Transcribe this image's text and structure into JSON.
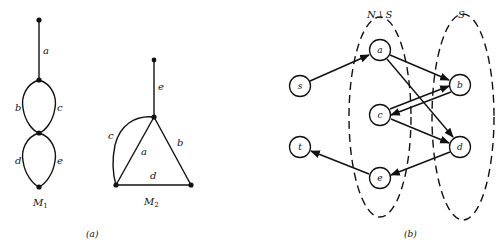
{
  "panel_a": {
    "caption": "(a)",
    "m1": {
      "name_main": "M",
      "name_sub": "1",
      "edges": {
        "a": "a",
        "b": "b",
        "c": "c",
        "d": "d",
        "e": "e"
      }
    },
    "m2": {
      "name_main": "M",
      "name_sub": "2",
      "edges": {
        "a": "a",
        "b": "b",
        "c": "c",
        "d": "d",
        "e": "e"
      }
    }
  },
  "panel_b": {
    "caption": "(b)",
    "set_labels": {
      "complement": "N \\ S",
      "s_set": "S"
    },
    "nodes": {
      "s": "s",
      "t": "t",
      "a": "a",
      "b": "b",
      "c": "c",
      "d": "d",
      "e": "e"
    },
    "arcs": [
      {
        "from": "s",
        "to": "a"
      },
      {
        "from": "a",
        "to": "b"
      },
      {
        "from": "a",
        "to": "d"
      },
      {
        "from": "c",
        "to": "b"
      },
      {
        "from": "b",
        "to": "c"
      },
      {
        "from": "c",
        "to": "d"
      },
      {
        "from": "d",
        "to": "e"
      },
      {
        "from": "e",
        "to": "t"
      }
    ]
  }
}
